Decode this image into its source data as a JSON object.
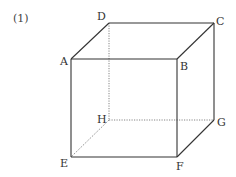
{
  "problem_number": "(1)",
  "figure": {
    "type": "cube",
    "colors": {
      "solid_edge": "#333333",
      "hidden_edge": "#777777"
    },
    "vertices": {
      "A": {
        "label": "A",
        "x": 71,
        "y": 59
      },
      "B": {
        "label": "B",
        "x": 177,
        "y": 59
      },
      "C": {
        "label": "C",
        "x": 214,
        "y": 23
      },
      "D": {
        "label": "D",
        "x": 109,
        "y": 23
      },
      "E": {
        "label": "E",
        "x": 71,
        "y": 157
      },
      "F": {
        "label": "F",
        "x": 177,
        "y": 157
      },
      "G": {
        "label": "G",
        "x": 214,
        "y": 120
      },
      "H": {
        "label": "H",
        "x": 109,
        "y": 120
      }
    },
    "solid_edges": [
      "AB",
      "BF",
      "FE",
      "EA",
      "AD",
      "DC",
      "CB",
      "CG",
      "GF"
    ],
    "hidden_edges": [
      "DH",
      "HE",
      "HG"
    ]
  }
}
